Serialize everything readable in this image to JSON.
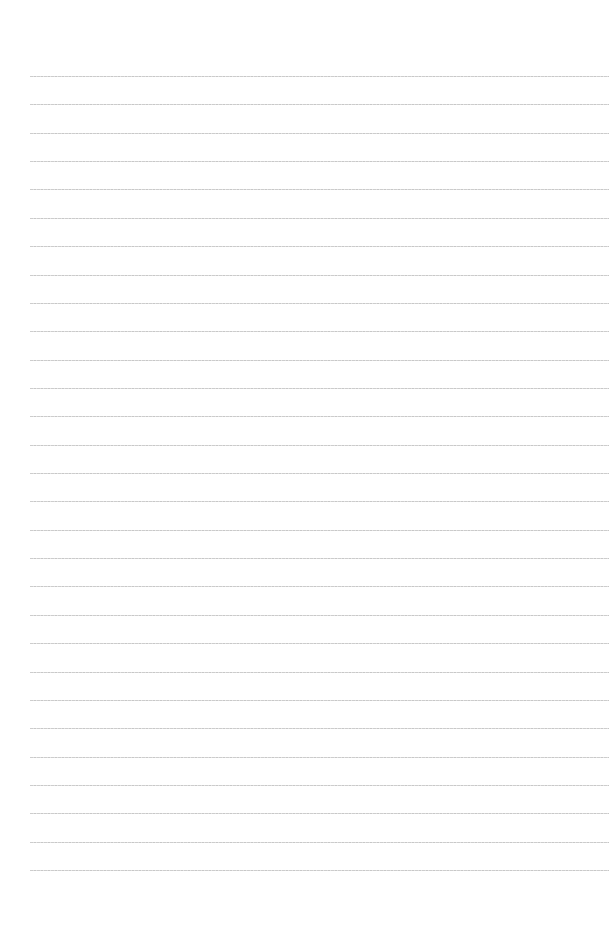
{
  "page": {
    "type": "ruled-paper",
    "background_color": "#ffffff",
    "line_color": "#c4c4c4",
    "line_count": 29,
    "first_line_y": 76,
    "line_spacing": 28.36,
    "line_left": 30,
    "line_right": 609
  }
}
